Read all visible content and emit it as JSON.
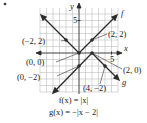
{
  "diagram": {
    "bullet": "•",
    "axes": {
      "x_label": "x",
      "y_label": "y",
      "x_tick_label": "5",
      "y_tick_label": "5"
    },
    "curve_labels": {
      "f": "f",
      "g": "g"
    },
    "points": [
      {
        "label": "(−2, 2)",
        "x": -2,
        "y": 2,
        "curve": "f"
      },
      {
        "label": "(2, 2)",
        "x": 2,
        "y": 2,
        "curve": "f"
      },
      {
        "label": "(0, 0)",
        "x": 0,
        "y": 0,
        "curve": "f"
      },
      {
        "label": "(0, −2)",
        "x": 0,
        "y": -2,
        "curve": "g"
      },
      {
        "label": "(2, 0)",
        "x": 2,
        "y": 0,
        "curve": "g"
      },
      {
        "label": "(4, −2)",
        "x": 4,
        "y": -2,
        "curve": "g"
      }
    ],
    "equations": {
      "f": "f(x) = |x|",
      "g": "g(x) = −|x − 2|"
    },
    "colors": {
      "line": "#2a2a2a",
      "grid": "#b8b8b8",
      "text": "#222222"
    }
  }
}
